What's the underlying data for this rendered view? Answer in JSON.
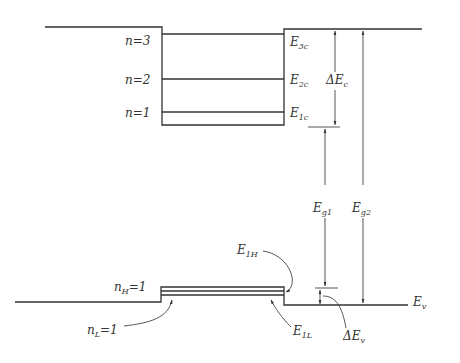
{
  "figure": {
    "conduction_band": {
      "levels": [
        {
          "label_n": "n",
          "value": "3",
          "energy_label": "E",
          "energy_sub": "3c"
        },
        {
          "label_n": "n",
          "value": "2",
          "energy_label": "E",
          "energy_sub": "2c"
        },
        {
          "label_n": "n",
          "value": "1",
          "energy_label": "E",
          "energy_sub": "1c"
        }
      ],
      "offset_label": "ΔE",
      "offset_sub": "c"
    },
    "valence_band": {
      "heavy_hole": {
        "label": "n",
        "sub": "H",
        "value": "1",
        "energy_label": "E",
        "energy_sub": "1H"
      },
      "light_hole": {
        "label": "n",
        "sub": "L",
        "value": "1",
        "energy_label": "E",
        "energy_sub": "1L"
      },
      "edge_label": "E",
      "edge_sub": "v",
      "offset_label": "ΔE",
      "offset_sub": "v"
    },
    "gaps": [
      {
        "label": "E",
        "sub": "g1"
      },
      {
        "label": "E",
        "sub": "g2"
      }
    ],
    "equals": "="
  }
}
